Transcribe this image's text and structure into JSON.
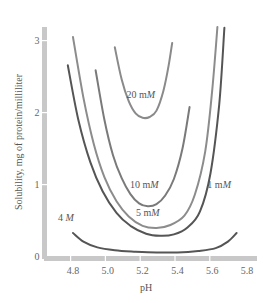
{
  "chart_data": {
    "type": "line",
    "title": "",
    "xlabel": "pH",
    "ylabel": "Solubility, mg of protein/milliliter",
    "xlim": [
      4.7,
      5.8
    ],
    "ylim": [
      0,
      3.2
    ],
    "grid": false,
    "legend": "inline labels on curves",
    "x_ticks": [
      "4.8",
      "5.0",
      "5.2",
      "5.4",
      "5.6",
      "5.8"
    ],
    "y_ticks": [
      "0",
      "1",
      "2",
      "3"
    ],
    "series": [
      {
        "name": "20 mM",
        "label_parts": [
          "20 m",
          "M"
        ],
        "color": "#8a8a8a",
        "x": [
          5.04,
          5.08,
          5.12,
          5.16,
          5.2,
          5.24,
          5.28,
          5.32,
          5.35,
          5.37
        ],
        "y": [
          2.9,
          2.45,
          2.15,
          1.98,
          1.92,
          1.93,
          2.02,
          2.3,
          2.65,
          2.96
        ]
      },
      {
        "name": "10 mM",
        "label_parts": [
          "10 m",
          "M"
        ],
        "color": "#7a7a7a",
        "x": [
          4.93,
          4.98,
          5.03,
          5.08,
          5.13,
          5.18,
          5.23,
          5.28,
          5.33,
          5.38,
          5.43,
          5.47
        ],
        "y": [
          2.58,
          1.9,
          1.4,
          1.08,
          0.86,
          0.73,
          0.69,
          0.72,
          0.84,
          1.07,
          1.5,
          2.07
        ]
      },
      {
        "name": "5 mM",
        "label_parts": [
          "5 m",
          "M"
        ],
        "color": "#8c8c8c",
        "x": [
          4.8,
          4.86,
          4.92,
          4.98,
          5.05,
          5.12,
          5.2,
          5.28,
          5.36,
          5.44,
          5.5,
          5.56,
          5.6,
          5.63
        ],
        "y": [
          3.04,
          2.2,
          1.55,
          1.1,
          0.76,
          0.55,
          0.42,
          0.39,
          0.43,
          0.56,
          0.85,
          1.45,
          2.3,
          3.18
        ]
      },
      {
        "name": "1 mM",
        "label_parts": [
          "1 m",
          "M"
        ],
        "color": "#555555",
        "x": [
          4.77,
          4.83,
          4.9,
          4.97,
          5.05,
          5.13,
          5.22,
          5.3,
          5.38,
          5.46,
          5.53,
          5.59,
          5.64,
          5.67
        ],
        "y": [
          2.65,
          1.9,
          1.3,
          0.9,
          0.6,
          0.42,
          0.31,
          0.28,
          0.3,
          0.4,
          0.62,
          1.15,
          2.1,
          3.17
        ]
      },
      {
        "name": "4 M",
        "label_parts": [
          "4 ",
          "M"
        ],
        "color": "#555555",
        "x": [
          4.8,
          4.86,
          4.94,
          5.04,
          5.16,
          5.28,
          5.4,
          5.52,
          5.62,
          5.69,
          5.74
        ],
        "y": [
          0.32,
          0.2,
          0.12,
          0.08,
          0.06,
          0.05,
          0.05,
          0.07,
          0.11,
          0.2,
          0.32
        ]
      }
    ],
    "annotations": [
      {
        "text": "20 mM",
        "x": 5.19,
        "y": 2.2
      },
      {
        "text": "10 mM",
        "x": 5.21,
        "y": 0.95
      },
      {
        "text": "5 mM",
        "x": 5.23,
        "y": 0.55
      },
      {
        "text": "1 mM",
        "x": 5.64,
        "y": 0.95
      },
      {
        "text": "4 M",
        "x": 4.76,
        "y": 0.48
      }
    ]
  },
  "colors": {
    "axis_bar": "#c8c8c8",
    "tick_text": "#666666"
  }
}
